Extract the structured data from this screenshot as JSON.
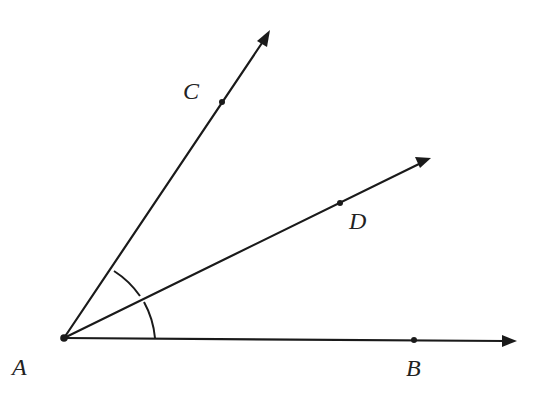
{
  "diagram": {
    "type": "geometry-angle-bisector",
    "vertex": {
      "label": "A",
      "x": 64,
      "y": 338,
      "label_x": 12,
      "label_y": 375
    },
    "rays": [
      {
        "name": "ray-AC",
        "through_point": {
          "label": "C",
          "x": 222,
          "y": 102,
          "label_x": 183,
          "label_y": 99
        },
        "tip": {
          "x": 270,
          "y": 30
        }
      },
      {
        "name": "ray-AD",
        "through_point": {
          "label": "D",
          "x": 340,
          "y": 203,
          "label_x": 349,
          "label_y": 229
        },
        "tip": {
          "x": 431,
          "y": 158
        }
      },
      {
        "name": "ray-AB",
        "through_point": {
          "label": "B",
          "x": 414,
          "y": 340,
          "label_x": 406,
          "label_y": 376
        },
        "tip": {
          "x": 516,
          "y": 341
        }
      }
    ],
    "angle_marks": [
      {
        "name": "angle-CAD-arc",
        "from": "C",
        "to": "D"
      },
      {
        "name": "angle-DAB-arc",
        "from": "D",
        "to": "B"
      }
    ],
    "colors": {
      "stroke": "#1a1a1a",
      "background": "#ffffff"
    }
  },
  "labels": {
    "A": "A",
    "B": "B",
    "C": "C",
    "D": "D"
  }
}
